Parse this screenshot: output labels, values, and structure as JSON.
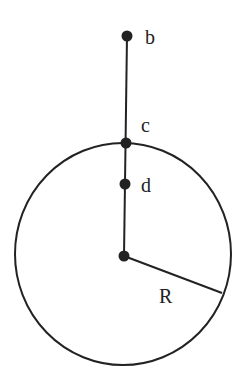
{
  "diagram": {
    "colors": {
      "stroke": "#222222",
      "point": "#222222",
      "background": "#ffffff"
    },
    "circle": {
      "cx": 123,
      "cy": 254,
      "rx": 108,
      "ry": 111
    },
    "vertical_line": {
      "x1": 127,
      "y1": 36,
      "x2": 124,
      "y2": 256
    },
    "radius_line": {
      "x1": 124,
      "y1": 256,
      "x2": 222,
      "y2": 293
    },
    "points": [
      {
        "id": "b",
        "x": 127,
        "y": 36
      },
      {
        "id": "c",
        "x": 126,
        "y": 143
      },
      {
        "id": "d",
        "x": 125,
        "y": 184
      },
      {
        "id": "center",
        "x": 124,
        "y": 256
      }
    ],
    "labels": [
      {
        "id": "b",
        "text": "b",
        "x": 145,
        "y": 44
      },
      {
        "id": "c",
        "text": "c",
        "x": 141,
        "y": 132
      },
      {
        "id": "d",
        "text": "d",
        "x": 141,
        "y": 192
      },
      {
        "id": "R",
        "text": "R",
        "x": 159,
        "y": 303
      }
    ]
  }
}
